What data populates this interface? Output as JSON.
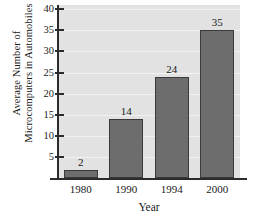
{
  "chart_data": {
    "type": "bar",
    "title": "",
    "categories": [
      "1980",
      "1990",
      "1994",
      "2000"
    ],
    "values": [
      2,
      14,
      24,
      35
    ],
    "value_labels": [
      "2",
      "14",
      "24",
      "35"
    ],
    "xlabel": "Year",
    "ylabel_lines": [
      "Average Number of",
      "Microcomputers in Automobiles"
    ],
    "ylabel": "Average Number of Microcomputers in Automobiles",
    "ylim": [
      0,
      41
    ],
    "yticks": [
      5,
      10,
      15,
      20,
      25,
      30,
      35,
      40
    ],
    "ytick_labels": [
      "5",
      "10",
      "15",
      "20",
      "25",
      "30",
      "35",
      "40"
    ],
    "grid": true,
    "grid_axis": "y",
    "legend": false,
    "bar_color": "#6d6d6d",
    "bar_edge_color": "#3a3a3a",
    "plot_background": "#e2e2e2",
    "gridline_color": "#f2f2f2",
    "axis_color": "#2b2b2b",
    "page_background": "#ffffff"
  }
}
